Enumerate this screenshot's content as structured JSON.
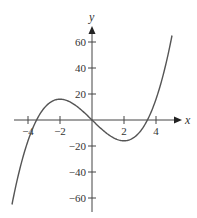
{
  "chart_data": {
    "type": "line",
    "title": "",
    "function": "y = x^3 - 12x",
    "xlabel": "x",
    "ylabel": "y",
    "xlim": [
      -5,
      5.5
    ],
    "ylim": [
      -70,
      72
    ],
    "x_ticks": [
      -4,
      -2,
      2,
      4
    ],
    "x_tick_labels": [
      "−4",
      "−2",
      "2",
      "4"
    ],
    "y_ticks": [
      60,
      40,
      20,
      -20,
      -40,
      -60
    ],
    "y_tick_labels": [
      "60",
      "40",
      "20",
      "−20",
      "−40",
      "−60"
    ],
    "grid": false,
    "legend": null,
    "series": [
      {
        "name": "curve",
        "x": [
          -5,
          -4.5,
          -4,
          -3.5,
          -3,
          -2.5,
          -2,
          -1.5,
          -1,
          -0.5,
          0,
          0.5,
          1,
          1.5,
          2,
          2.5,
          3,
          3.5,
          4,
          4.5,
          5
        ],
        "values": [
          -65,
          -37.1,
          -16,
          -0.9,
          9,
          14.4,
          16,
          14.6,
          11,
          5.9,
          0,
          -5.9,
          -11,
          -14.6,
          -16,
          -14.4,
          -9,
          0.9,
          16,
          37.1,
          65
        ]
      }
    ],
    "color": "#555555"
  }
}
